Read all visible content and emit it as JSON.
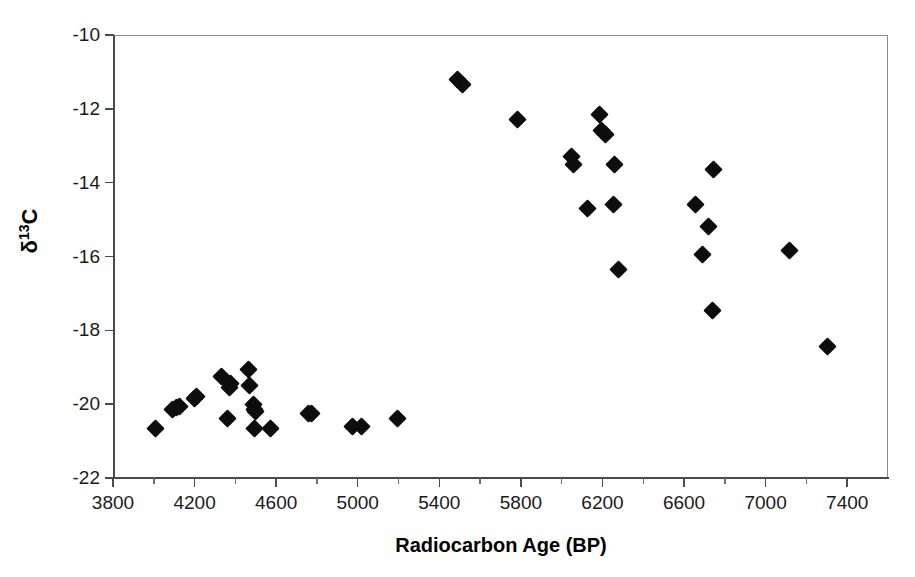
{
  "chart_data": {
    "type": "scatter",
    "title": "",
    "xlabel": "Radiocarbon Age (BP)",
    "ylabel": "δ 13C",
    "ylabel_base": "δ",
    "ylabel_sup": "13",
    "ylabel_tail": "C",
    "xlim": [
      3800,
      7600
    ],
    "ylim": [
      -22,
      -10
    ],
    "xticks": [
      3800,
      4200,
      4600,
      5000,
      5400,
      5800,
      6200,
      6600,
      7000,
      7400
    ],
    "xtick_labels": [
      "3800",
      "4200",
      "4600",
      "5000",
      "5400",
      "5800",
      "6200",
      "6600",
      "7000",
      "7400"
    ],
    "xtick_minor_step": 200,
    "yticks": [
      -10,
      -12,
      -14,
      -16,
      -18,
      -20,
      -22
    ],
    "ytick_labels": [
      "-10",
      "-12",
      "-14",
      "-16",
      "-18",
      "-20",
      "-22"
    ],
    "grid": false,
    "legend": false,
    "marker": "filled-diamond",
    "marker_color": "#0d0d0d",
    "frame_color": "#8d8d8d",
    "axis_color": "#4a4a4a",
    "series": [
      {
        "name": "samples",
        "points": [
          [
            4010,
            -20.65
          ],
          [
            4090,
            -20.15
          ],
          [
            4110,
            -20.1
          ],
          [
            4125,
            -20.05
          ],
          [
            4200,
            -19.85
          ],
          [
            4210,
            -19.8
          ],
          [
            4330,
            -19.25
          ],
          [
            4370,
            -19.55
          ],
          [
            4375,
            -19.45
          ],
          [
            4360,
            -20.4
          ],
          [
            4465,
            -19.05
          ],
          [
            4470,
            -19.5
          ],
          [
            4490,
            -20.0
          ],
          [
            4495,
            -20.15
          ],
          [
            4500,
            -20.2
          ],
          [
            4495,
            -20.65
          ],
          [
            4570,
            -20.65
          ],
          [
            4760,
            -20.25
          ],
          [
            4775,
            -20.25
          ],
          [
            4975,
            -20.6
          ],
          [
            5020,
            -20.6
          ],
          [
            5195,
            -20.4
          ],
          [
            5490,
            -11.2
          ],
          [
            5515,
            -11.35
          ],
          [
            5785,
            -12.3
          ],
          [
            6050,
            -13.3
          ],
          [
            6060,
            -13.5
          ],
          [
            6185,
            -12.15
          ],
          [
            6195,
            -12.6
          ],
          [
            6215,
            -12.7
          ],
          [
            6260,
            -13.5
          ],
          [
            6125,
            -14.7
          ],
          [
            6255,
            -14.6
          ],
          [
            6280,
            -16.35
          ],
          [
            6655,
            -14.6
          ],
          [
            6745,
            -13.65
          ],
          [
            6720,
            -15.2
          ],
          [
            6690,
            -15.95
          ],
          [
            6740,
            -17.45
          ],
          [
            7115,
            -15.85
          ],
          [
            7305,
            -18.45
          ]
        ]
      }
    ]
  },
  "figure": {
    "background": "#ffffff",
    "width": 915,
    "height": 577
  }
}
